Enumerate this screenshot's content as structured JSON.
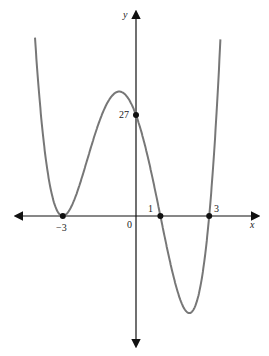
{
  "chart_data": {
    "type": "line",
    "title": "",
    "function": "y = (x+3)^2 (x-1)(x-3)",
    "xlabel": "x",
    "ylabel": "y",
    "origin_label": "0",
    "marked_points": [
      {
        "x": -3,
        "y": 0,
        "label": "-3"
      },
      {
        "x": 1,
        "y": 0,
        "label": "1"
      },
      {
        "x": 3,
        "y": 0,
        "label": "3"
      },
      {
        "x": 0,
        "y": 27,
        "label": "27"
      }
    ],
    "x_tick_labels": [
      "-3",
      "1",
      "3"
    ],
    "y_tick_labels": [
      "27"
    ],
    "xlim": [
      -4.2,
      4.3
    ],
    "ylim": [
      -35,
      50
    ],
    "grid": false,
    "curve_color": "#777777",
    "axis_color": "#111111"
  },
  "labels": {
    "y_axis": "y",
    "x_axis": "x",
    "origin": "0",
    "neg3": "−3",
    "one": "1",
    "three": "3",
    "y27": "27"
  }
}
